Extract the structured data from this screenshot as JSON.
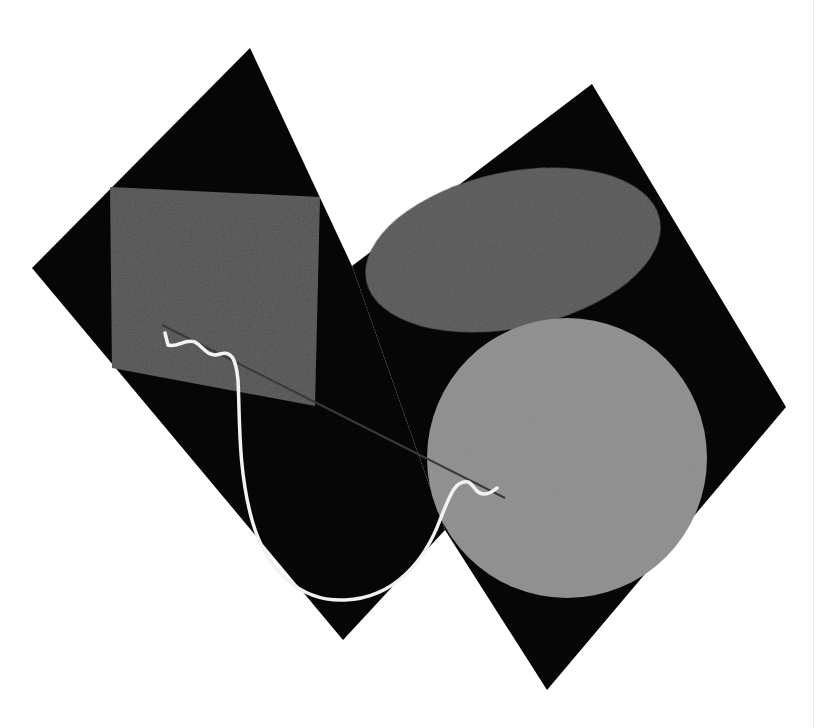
{
  "artwork": {
    "width": 824,
    "height": 728,
    "background": "#ffffff",
    "colors": {
      "black": "#060606",
      "dark_gray": "#4e4e4e",
      "ellipse_gray": "#525252",
      "circle_gray": "#8a8a8a",
      "white_line": "#f2f2f2",
      "thin_line": "#3a3a3a"
    },
    "shapes": {
      "left_diamond": "250,48 352,266 445,530 343,640 32,268",
      "right_diamond": "592,84 786,407 547,690 445,530 352,266",
      "rectangle": "110,187 320,197 315,406 112,368",
      "ellipse": {
        "cx": 513,
        "cy": 250,
        "rx": 150,
        "ry": 78,
        "rotate": -12
      },
      "circle": {
        "cx": 567,
        "cy": 458,
        "r": 140
      },
      "thin_line": "M162,325 L505,498",
      "white_curve": "M165,333 L168,345 C178,348 185,338 195,342 C205,348 208,358 220,354 C232,350 236,360 238,380 C240,420 238,470 252,520 C266,570 300,602 345,600 C395,598 425,560 440,520 C450,495 455,480 468,482 C474,484 475,494 484,494 C490,494 494,490 497,488"
    }
  }
}
